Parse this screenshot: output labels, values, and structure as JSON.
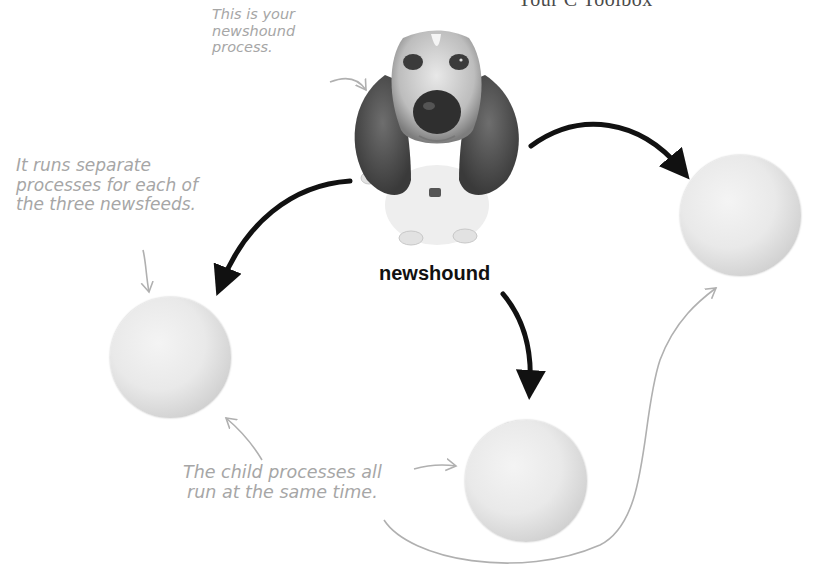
{
  "header": {
    "title": "Your C Toolbox"
  },
  "diagram": {
    "parent_process": {
      "label": "newshound",
      "icon": "basset-hound-dog-image"
    },
    "child_processes": [
      {
        "name": "child-process-left"
      },
      {
        "name": "child-process-right"
      },
      {
        "name": "child-process-bottom"
      }
    ],
    "annotations": {
      "parent_note": "This is your\nnewshound\nprocess.",
      "children_note": "It runs separate\nprocesses for each of\nthe three newsfeeds.",
      "concurrency_note": "The child processes all\nrun at the same time."
    },
    "colors": {
      "arrow_bold": "#111111",
      "annotation_text": "#a6a6a6",
      "annotation_arrow": "#b0b0b0"
    }
  }
}
